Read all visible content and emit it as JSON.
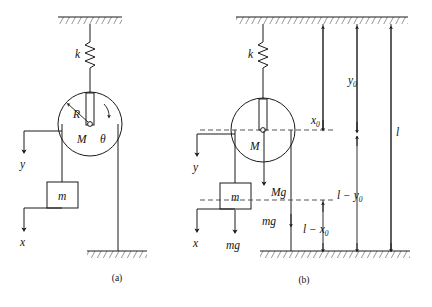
{
  "figure": {
    "type": "physics-mechanics-diagram",
    "panels": [
      {
        "id": "a",
        "caption": "(a)",
        "labels": {
          "spring_constant": "k",
          "pulley_radius": "R",
          "pulley_mass": "M",
          "rotation_angle": "θ",
          "hanging_mass": "m",
          "coord_y": "y",
          "coord_x": "x"
        }
      },
      {
        "id": "b",
        "caption": "(b)",
        "labels": {
          "spring_constant": "k",
          "pulley_mass": "M",
          "pulley_weight": "Mg",
          "hanging_mass": "m",
          "hanging_weight": "mg",
          "cord_weight": "mg",
          "coord_y": "y",
          "coord_x": "x"
        },
        "dimensions": [
          {
            "name": "x0",
            "label": "x₀",
            "base": "x",
            "sub": "0"
          },
          {
            "name": "y0",
            "label": "y₀",
            "base": "y",
            "sub": "0"
          },
          {
            "name": "l",
            "label": "l",
            "base": "l",
            "sub": ""
          },
          {
            "name": "l_minus_y0",
            "label": "l − y₀",
            "base": "l − y",
            "sub": "0"
          },
          {
            "name": "l_minus_x0",
            "label": "l − x₀",
            "base": "l − x",
            "sub": "0"
          }
        ]
      }
    ],
    "colors": {
      "ink": "#1a1a1a",
      "dashed": "#444444",
      "background": "#ffffff"
    }
  }
}
